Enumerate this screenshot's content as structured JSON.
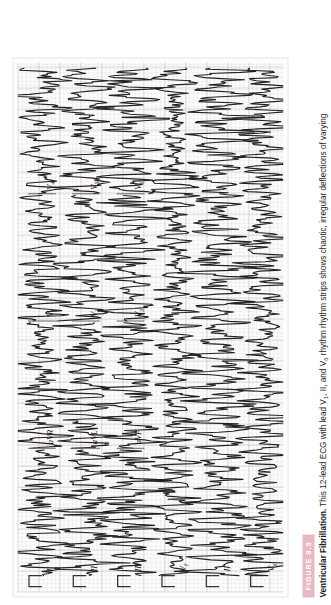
{
  "figure": {
    "badge_label": "FIGURE 8.9",
    "badge_color": "#e8b9c4",
    "title": "Ventricular Fibrillation.",
    "caption_body": " This 12-lead ECG with lead V1, II, and V6 rhythm rhythm strips shows chaotic, irregular deflections of varying amplitude without distinct P waves, QRS complexes, or T waves, consistent with ventricular fibrillation.",
    "caption_full": "Ventricular Fibrillation. This 12-lead ECG with lead V1, II, and V6 rhythm rhythm strips shows chaotic, irregular deflections of varying amplitude without distinct P waves, QRS complexes, or T waves, consistent with ventricular fibrillation."
  },
  "ecg": {
    "paper_label": "ecg-grid-paper",
    "grid_color": "#999999",
    "trace_color": "#222222",
    "rows": [
      {
        "row_index": 0,
        "leads": [
          {
            "label": "I",
            "sub": ""
          },
          {
            "label": "aVR",
            "sub": ""
          },
          {
            "label": "V",
            "sub": "1"
          },
          {
            "label": "V",
            "sub": "4"
          }
        ]
      },
      {
        "row_index": 1,
        "leads": [
          {
            "label": "II",
            "sub": ""
          },
          {
            "label": "aVL",
            "sub": ""
          },
          {
            "label": "V",
            "sub": "2"
          },
          {
            "label": "V",
            "sub": "5"
          }
        ]
      },
      {
        "row_index": 2,
        "leads": [
          {
            "label": "III",
            "sub": ""
          },
          {
            "label": "aVF",
            "sub": ""
          },
          {
            "label": "V",
            "sub": "3"
          },
          {
            "label": "V",
            "sub": "6"
          }
        ]
      },
      {
        "row_index": 3,
        "leads": [
          {
            "label": "V",
            "sub": "1"
          }
        ]
      },
      {
        "row_index": 4,
        "leads": [
          {
            "label": "II",
            "sub": ""
          }
        ]
      },
      {
        "row_index": 5,
        "leads": [
          {
            "label": "V",
            "sub": "6"
          }
        ]
      }
    ]
  },
  "chart_data": {
    "type": "line",
    "xlabel": "Time",
    "ylabel": "Amplitude (mV)",
    "grid": true,
    "legend": "none",
    "rhythm": "ventricular fibrillation",
    "strip_count": 6,
    "calibration_pulse_mv": 1.0,
    "paper_speed_mm_per_s": 25,
    "gain_mm_per_mV": 10,
    "series": [
      {
        "name": "Row 1 (I / aVR / V1 / V4)",
        "amplitude": 0.55,
        "irregularity": 0.9
      },
      {
        "name": "Row 2 (II / aVL / V2 / V5)",
        "amplitude": 0.75,
        "irregularity": 0.9
      },
      {
        "name": "Row 3 (III / aVF / V3 / V6)",
        "amplitude": 0.8,
        "irregularity": 0.95
      },
      {
        "name": "Rhythm strip V1",
        "amplitude": 0.5,
        "irregularity": 0.85
      },
      {
        "name": "Rhythm strip II",
        "amplitude": 0.95,
        "irregularity": 0.95
      },
      {
        "name": "Rhythm strip V6",
        "amplitude": 0.6,
        "irregularity": 0.88
      }
    ]
  }
}
